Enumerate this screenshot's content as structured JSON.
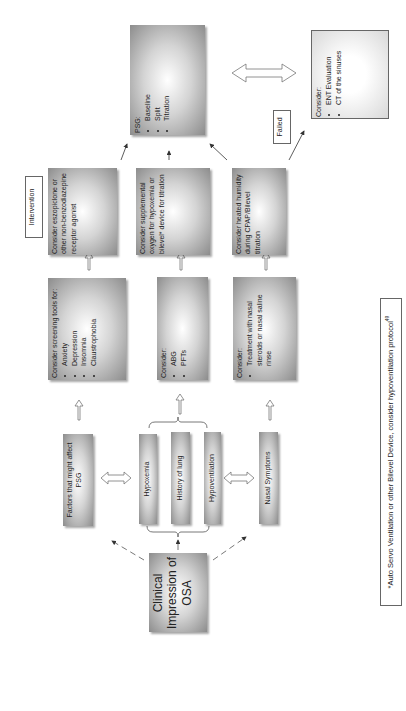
{
  "diagram": {
    "orientation": "rotated 90° counter-clockwise",
    "start": {
      "label": "Clinical Impression of OSA"
    },
    "assessments": [
      {
        "id": "factors",
        "label": "Factors that might affect PSG"
      },
      {
        "id": "hypoxemia",
        "label": "Hypoxemia"
      },
      {
        "id": "history",
        "label": "History of lung"
      },
      {
        "id": "hypoventilation",
        "label": "Hypoventilation"
      },
      {
        "id": "nasal",
        "label": "Nasal Symptoms"
      }
    ],
    "considerations": [
      {
        "title": "Consider screening tools for:",
        "items": [
          "Anxiety",
          "Depression",
          "Insomnia",
          "Claustrophobia"
        ]
      },
      {
        "title": "Consider:",
        "items": [
          "ABG",
          "PFTs"
        ]
      },
      {
        "title": "Consider:",
        "items": [
          "Treatment with nasal steroids or nasal saline rinse"
        ]
      }
    ],
    "intervention_label": "Intervention",
    "interventions": [
      {
        "text": "Consider eszopiclone or other non-benzodiazepine receptor agonist"
      },
      {
        "text": "Consider supplemental oxygen for hypoxemia or bilevel* device for titration"
      },
      {
        "text": "Consider heated humidity during CPAP/Bilevel titration"
      }
    ],
    "psg": {
      "title": "PSG:",
      "items": [
        "Baseline",
        "Split",
        "Titration"
      ]
    },
    "failed_label": "Failed",
    "ent": {
      "title": "Consider:",
      "items": [
        "ENT Evaluation",
        "CT of the sinuses"
      ]
    },
    "footnote": "*Auto Servo Ventilation or other Bilevel Device, consider hypoventilation protocol",
    "footnote_ref": "49"
  }
}
